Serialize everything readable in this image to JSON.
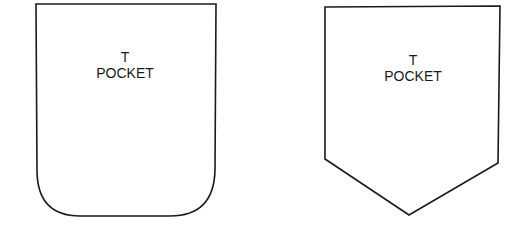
{
  "pockets": [
    {
      "shape": "rounded-bottom",
      "line1": "T",
      "line2": "POCKET"
    },
    {
      "shape": "pointed-bottom",
      "line1": "T",
      "line2": "POCKET"
    }
  ],
  "colors": {
    "stroke": "#1a1a1a",
    "background": "#ffffff"
  }
}
